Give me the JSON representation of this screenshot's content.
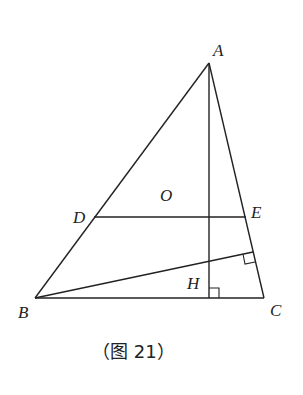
{
  "figure": {
    "caption": "（图 21）",
    "points": {
      "A": {
        "label": "A",
        "x": 209,
        "y": 63,
        "lx": 213,
        "ly": 56
      },
      "B": {
        "label": "B",
        "x": 35,
        "y": 298,
        "lx": 18,
        "ly": 318
      },
      "C": {
        "label": "C",
        "x": 264,
        "y": 298,
        "lx": 270,
        "ly": 316
      },
      "D": {
        "label": "D",
        "x": 94,
        "y": 217,
        "lx": 73,
        "ly": 223
      },
      "E": {
        "label": "E",
        "x": 246,
        "y": 217,
        "lx": 251,
        "ly": 218
      },
      "O": {
        "label": "O",
        "x": 167,
        "y": 200,
        "lx": 160,
        "ly": 201
      },
      "H": {
        "label": "H",
        "x": 209,
        "y": 261,
        "lx": 187,
        "ly": 289
      },
      "F": {
        "x": 253,
        "y": 252
      },
      "foot": {
        "x": 209,
        "y": 298
      }
    },
    "segments": [
      [
        "A",
        "B"
      ],
      [
        "A",
        "C"
      ],
      [
        "B",
        "C"
      ],
      [
        "D",
        "E"
      ],
      [
        "A",
        "foot"
      ],
      [
        "B",
        "F"
      ]
    ],
    "right_angles": [
      "foot-of-altitude-on-BC",
      "F-on-AC"
    ]
  }
}
